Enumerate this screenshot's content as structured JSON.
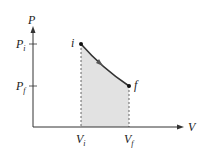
{
  "diagram": {
    "type": "PV diagram",
    "axes": {
      "x_label": "V",
      "y_label": "P"
    },
    "y_ticks": [
      {
        "label": "P",
        "sub": "i"
      },
      {
        "label": "P",
        "sub": "f"
      }
    ],
    "x_ticks": [
      {
        "label": "V",
        "sub": "i"
      },
      {
        "label": "V",
        "sub": "f"
      }
    ],
    "points": [
      {
        "label": "i"
      },
      {
        "label": "f"
      }
    ],
    "colors": {
      "curve": "#333333",
      "fill": "#e2e2e2",
      "axis": "#333333"
    }
  }
}
